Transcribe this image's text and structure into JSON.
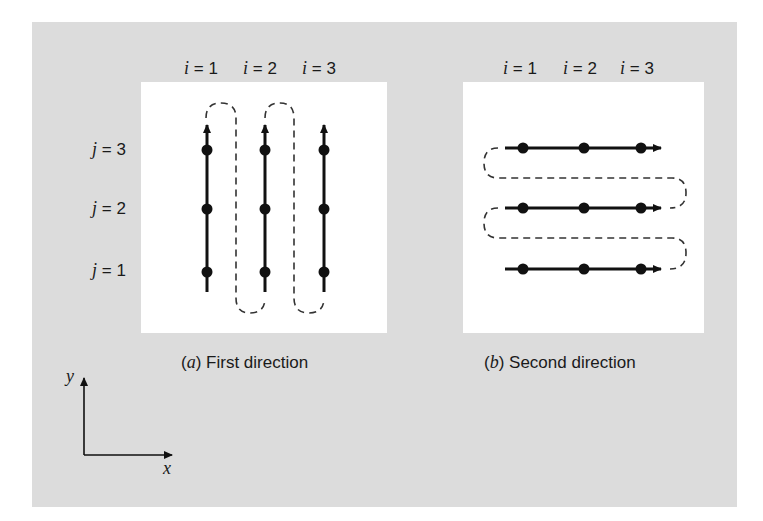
{
  "figure": {
    "background_color": "#dcdcdc",
    "panel_color": "#ffffff",
    "ink_color": "#111111"
  },
  "panel_a": {
    "column_labels": [
      {
        "var": "i",
        "eq": " = 1"
      },
      {
        "var": "i",
        "eq": " = 2"
      },
      {
        "var": "i",
        "eq": " = 3"
      }
    ],
    "row_labels": [
      {
        "var": "j",
        "eq": " = 3"
      },
      {
        "var": "j",
        "eq": " = 2"
      },
      {
        "var": "j",
        "eq": " = 1"
      }
    ],
    "caption_tag": "(a)",
    "caption_letter": "a",
    "caption_text": "First direction",
    "sweep": "vertical lines traversed upward, connected by dashed return loops"
  },
  "panel_b": {
    "column_labels": [
      {
        "var": "i",
        "eq": " = 1"
      },
      {
        "var": "i",
        "eq": " = 2"
      },
      {
        "var": "i",
        "eq": " = 3"
      }
    ],
    "caption_letter": "b",
    "caption_text": "Second direction",
    "sweep": "horizontal lines traversed rightward, connected by dashed return loops"
  },
  "axes": {
    "x_label": "x",
    "y_label": "y"
  }
}
